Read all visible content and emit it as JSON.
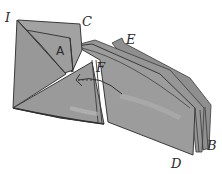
{
  "figure": {
    "type": "origami-fold-diagram",
    "labels": [
      {
        "id": "I",
        "text": "I",
        "x": 5,
        "y": 22
      },
      {
        "id": "C",
        "text": "C",
        "x": 82,
        "y": 26
      },
      {
        "id": "A",
        "text": "A",
        "x": 56,
        "y": 55
      },
      {
        "id": "E",
        "text": "E",
        "x": 126,
        "y": 44
      },
      {
        "id": "F",
        "text": "F",
        "x": 96,
        "y": 72
      },
      {
        "id": "B",
        "text": "B",
        "x": 207,
        "y": 150
      },
      {
        "id": "D",
        "text": "D",
        "x": 171,
        "y": 168
      }
    ],
    "arrow": {
      "kind": "curved-fold-arrow",
      "direction": "left",
      "style": "dashed-tail"
    }
  },
  "colors": {
    "paper": "#9a9a9a",
    "paper_light": "#a8a8a8",
    "paper_dark": "#8a8a8a",
    "ink": "#3a3a3a",
    "background": "#ffffff"
  }
}
